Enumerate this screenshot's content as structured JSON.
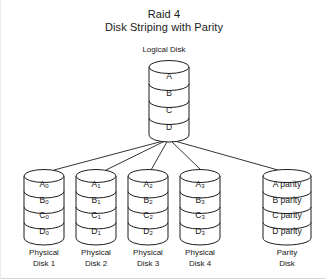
{
  "title": {
    "line1": "Raid 4",
    "line2": "Disk Striping with Parity"
  },
  "logical_disk": {
    "caption": "Logical Disk",
    "cells": [
      "A",
      "B",
      "C",
      "D"
    ]
  },
  "physical_disks": [
    {
      "caption_line1": "Physical",
      "caption_line2": "Disk 1",
      "cells": [
        {
          "base": "A",
          "sub": "0"
        },
        {
          "base": "B",
          "sub": "0"
        },
        {
          "base": "C",
          "sub": "0"
        },
        {
          "base": "D",
          "sub": "0"
        }
      ]
    },
    {
      "caption_line1": "Physical",
      "caption_line2": "Disk 2",
      "cells": [
        {
          "base": "A",
          "sub": "1"
        },
        {
          "base": "B",
          "sub": "1"
        },
        {
          "base": "C",
          "sub": "1"
        },
        {
          "base": "D",
          "sub": "1"
        }
      ]
    },
    {
      "caption_line1": "Physical",
      "caption_line2": "Disk 3",
      "cells": [
        {
          "base": "A",
          "sub": "2"
        },
        {
          "base": "B",
          "sub": "2"
        },
        {
          "base": "C",
          "sub": "2"
        },
        {
          "base": "D",
          "sub": "2"
        }
      ]
    },
    {
      "caption_line1": "Physical",
      "caption_line2": "Disk 4",
      "cells": [
        {
          "base": "A",
          "sub": "3"
        },
        {
          "base": "B",
          "sub": "3"
        },
        {
          "base": "C",
          "sub": "3"
        },
        {
          "base": "D",
          "sub": "3"
        }
      ]
    }
  ],
  "parity_disk": {
    "caption_line1": "Parity",
    "caption_line2": "Disk",
    "cells": [
      "A parity",
      "B parity",
      "C parity",
      "D parity"
    ]
  },
  "colors": {
    "stroke": "#1d1d1d",
    "fill": "#ffffff",
    "background": "#ffffff",
    "text": "#161616"
  }
}
